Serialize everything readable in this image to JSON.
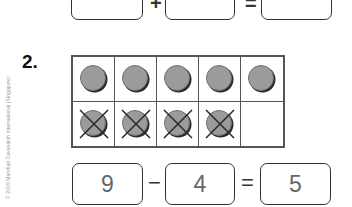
{
  "copyright": "© 2009 Marshall Cavendish International (Singapore)",
  "previous_question": {
    "equation": {
      "a": "8",
      "op1": "+",
      "b": "2",
      "op2": "=",
      "result": "10"
    }
  },
  "question": {
    "number": "2.",
    "ten_frame": {
      "rows": 2,
      "cols": 5,
      "cells": [
        {
          "counter": true,
          "crossed": false
        },
        {
          "counter": true,
          "crossed": false
        },
        {
          "counter": true,
          "crossed": false
        },
        {
          "counter": true,
          "crossed": false
        },
        {
          "counter": true,
          "crossed": false
        },
        {
          "counter": true,
          "crossed": true
        },
        {
          "counter": true,
          "crossed": true
        },
        {
          "counter": true,
          "crossed": true
        },
        {
          "counter": true,
          "crossed": true
        },
        {
          "counter": false,
          "crossed": false
        }
      ]
    },
    "equation": {
      "a": "9",
      "op1": "−",
      "b": "4",
      "op2": "=",
      "result": "5"
    }
  },
  "colors": {
    "counter_fill": "#9b9b9b",
    "line": "#333333",
    "answer_text": "#666666"
  }
}
